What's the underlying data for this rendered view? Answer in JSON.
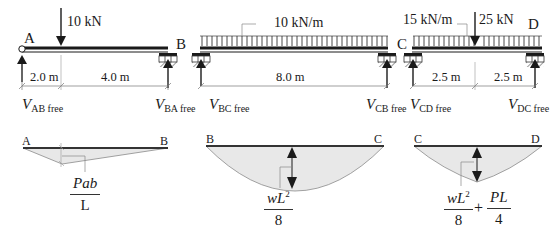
{
  "figure": {
    "type": "free-body beam spans with simply-supported bending moment diagrams",
    "colors": {
      "beam": "#1a1a1a",
      "moment_fill": "#e8e8e8",
      "moment_outline": "#8a8a8a",
      "leader": "#888888"
    }
  },
  "spans": [
    {
      "id": "AB",
      "left_node": "A",
      "right_node": "B",
      "load": {
        "kind": "point",
        "label": "10 kN"
      },
      "dimensions": [
        "2.0 m",
        "4.0 m"
      ],
      "reactions": {
        "left": {
          "symbol": "V",
          "subscript": "AB free"
        },
        "right": {
          "symbol": "V",
          "subscript": "BA free"
        }
      },
      "moment_diagram": {
        "shape": "triangle",
        "left_node": "A",
        "right_node": "B",
        "formula": {
          "numerator": "Pab",
          "denominator": "L"
        }
      }
    },
    {
      "id": "BC",
      "left_node": "B",
      "right_node": "C",
      "load": {
        "kind": "uniform",
        "label": "10 kN/m"
      },
      "dimensions": [
        "8.0 m"
      ],
      "reactions": {
        "left": {
          "symbol": "V",
          "subscript": "BC free"
        },
        "right": {
          "symbol": "V",
          "subscript": "CB free"
        }
      },
      "moment_diagram": {
        "shape": "parabola",
        "left_node": "B",
        "right_node": "C",
        "formula": {
          "numerator": "wL",
          "numerator_sup": "2",
          "denominator": "8"
        }
      }
    },
    {
      "id": "CD",
      "left_node": "C",
      "right_node": "D",
      "load": {
        "kind": "uniform+point",
        "uniform_label": "15 kN/m",
        "point_label": "25 kN"
      },
      "dimensions": [
        "2.5 m",
        "2.5 m"
      ],
      "reactions": {
        "left": {
          "symbol": "V",
          "subscript": "CD free"
        },
        "right": {
          "symbol": "V",
          "subscript": "DC free"
        }
      },
      "moment_diagram": {
        "shape": "parabola+triangle",
        "left_node": "C",
        "right_node": "D",
        "formula": {
          "term1": {
            "numerator": "wL",
            "numerator_sup": "2",
            "denominator": "8"
          },
          "operator": "+",
          "term2": {
            "numerator": "PL",
            "denominator": "4"
          }
        }
      }
    }
  ]
}
